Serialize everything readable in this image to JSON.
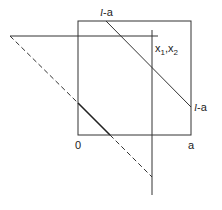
{
  "diagram": {
    "labels": {
      "top": {
        "l": "l",
        "rest": "-a"
      },
      "right": {
        "l": "l",
        "rest": "-a"
      },
      "origin": "0",
      "a": "a",
      "x": "x",
      "sub1": "1",
      "comma": ",",
      "x2": "x",
      "sub2": "2"
    },
    "colors": {
      "line": "#333333",
      "background": "#ffffff"
    }
  }
}
